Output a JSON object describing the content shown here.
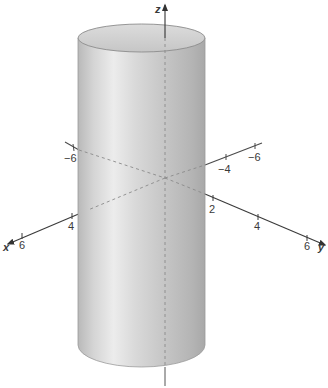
{
  "figure": {
    "surface_color": "#c9c9c9",
    "axis_color": "#4a4a4a",
    "hidden_axis_style": "dashed"
  },
  "axes": {
    "x": {
      "label": "x",
      "ticks": [
        {
          "value": -6,
          "label": "−6"
        },
        {
          "value": 4,
          "label": "4"
        },
        {
          "value": 6,
          "label": "6"
        }
      ]
    },
    "y": {
      "label": "y",
      "ticks": [
        {
          "value": -6,
          "label": "−6"
        },
        {
          "value": -4,
          "label": "−4"
        },
        {
          "value": 2,
          "label": "2"
        },
        {
          "value": 4,
          "label": "4"
        },
        {
          "value": 6,
          "label": "6"
        }
      ]
    },
    "z": {
      "label": "z"
    }
  }
}
